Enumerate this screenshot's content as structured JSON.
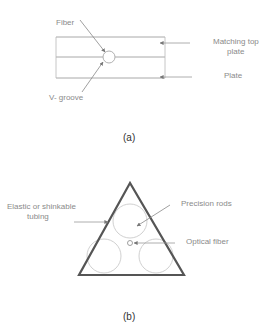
{
  "figure_a": {
    "caption": "(a)",
    "labels": {
      "fiber": "Fiber",
      "v_groove": "V- groove",
      "matching_top_plate_line1": "Matching top",
      "matching_top_plate_line2": "plate",
      "plate": "Plate"
    }
  },
  "figure_b": {
    "caption": "(b)",
    "labels": {
      "tubing_line1": "Elastic or shinkable",
      "tubing_line2": "tubing",
      "precision_rods": "Precision rods",
      "optical_fiber": "Optical fiber"
    }
  },
  "colors": {
    "line": "#9a9a9a",
    "triangle": "#555555",
    "text": "#8a8a8a",
    "caption": "#333333"
  }
}
